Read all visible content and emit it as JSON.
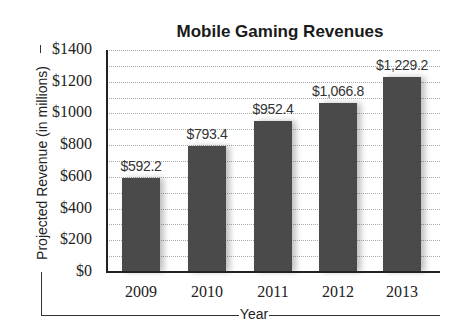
{
  "chart_data": {
    "type": "bar",
    "title": "Mobile Gaming Revenues",
    "xlabel": "Year",
    "ylabel": "Projected Revenue (in millions)",
    "categories": [
      "2009",
      "2010",
      "2011",
      "2012",
      "2013"
    ],
    "values": [
      592.2,
      793.4,
      952.4,
      1066.8,
      1229.2
    ],
    "data_labels": [
      "$592.2",
      "$793.4",
      "$952.4",
      "$1,066.8",
      "$1,229.2"
    ],
    "ylim": [
      0,
      1400
    ],
    "yticks": [
      "$0",
      "$200",
      "$400",
      "$600",
      "$800",
      "$1000",
      "$1200",
      "$1400"
    ],
    "ytick_values": [
      0,
      200,
      400,
      600,
      800,
      1000,
      1200,
      1400
    ],
    "grid": true,
    "grid_step": 100,
    "legend": null,
    "bar_color": "#4a4a4a"
  }
}
